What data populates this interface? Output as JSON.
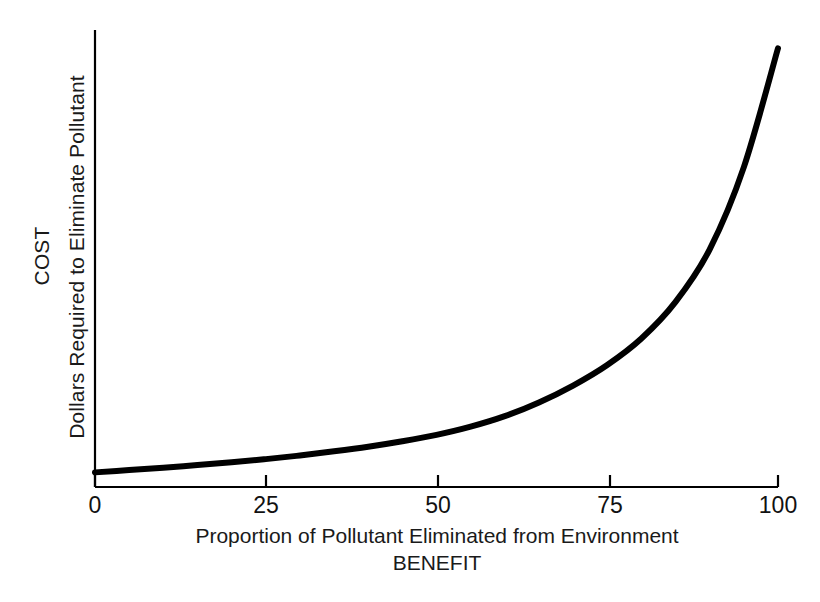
{
  "figure": {
    "background_color": "#ffffff",
    "ink_color": "#000000"
  },
  "chart_data": {
    "type": "line",
    "title": "",
    "subtitle": "",
    "xlabel": "Proportion of Pollutant Eliminated from Environment",
    "xlabel_secondary": "BENEFIT",
    "ylabel": "COST",
    "ylabel_secondary": "Dollars Required to Eliminate Pollutant",
    "xlim": [
      0,
      100
    ],
    "ylim": [
      0,
      1
    ],
    "xticks": [
      0,
      25,
      50,
      75,
      100
    ],
    "xticklabels": [
      "0",
      "25",
      "50",
      "75",
      "100"
    ],
    "yticks": [],
    "yticklabels": [],
    "grid": false,
    "legend": false,
    "legend_position": "none",
    "annotations": [],
    "series": [
      {
        "name": "Cost to eliminate pollutant",
        "color": "#000000",
        "line_width": 6,
        "x": [
          0,
          5,
          10,
          15,
          20,
          25,
          30,
          35,
          40,
          45,
          50,
          55,
          60,
          65,
          70,
          75,
          80,
          85,
          90,
          95,
          100
        ],
        "y": [
          0.032,
          0.037,
          0.042,
          0.048,
          0.054,
          0.061,
          0.069,
          0.078,
          0.088,
          0.1,
          0.114,
          0.132,
          0.155,
          0.185,
          0.222,
          0.267,
          0.325,
          0.405,
          0.52,
          0.7,
          0.96
        ]
      }
    ]
  },
  "geometry": {
    "plot_left": 95,
    "plot_right": 778,
    "plot_top": 30,
    "plot_bottom": 487,
    "tick_length": 12,
    "axis_line_width": 2.2
  },
  "ticks": [
    {
      "value": 0,
      "label": "0",
      "x": 95
    },
    {
      "value": 25,
      "label": "25",
      "x": 266
    },
    {
      "value": 50,
      "label": "50",
      "x": 438
    },
    {
      "value": 75,
      "label": "75",
      "x": 610
    },
    {
      "value": 100,
      "label": "100",
      "x": 778
    }
  ]
}
